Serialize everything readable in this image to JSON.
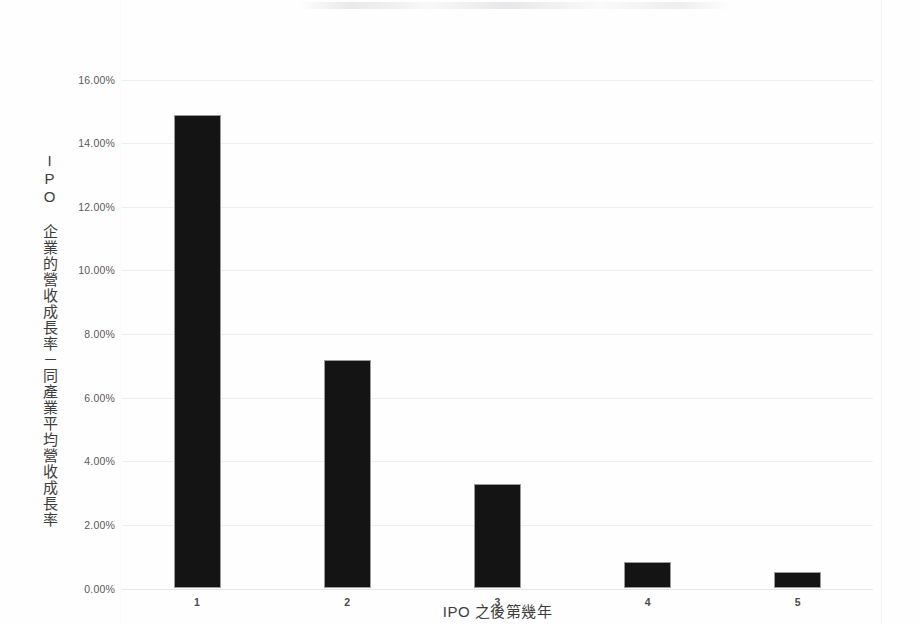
{
  "chart_data": {
    "type": "bar",
    "title": "",
    "subtitle": "",
    "categories": [
      "1",
      "2",
      "3",
      "4",
      "5"
    ],
    "values": [
      14.87,
      7.18,
      3.28,
      0.82,
      0.5
    ],
    "series": [
      {
        "name": "IPO 企業的營收成長率－同產業平均營收成長率",
        "values": [
          14.87,
          7.18,
          3.28,
          0.82,
          0.5
        ]
      }
    ],
    "xlabel": "IPO 之後第幾年",
    "ylabel": "IPO 企業的營收成長率－同產業平均營收成長率",
    "ylim": [
      0,
      16
    ],
    "ytick_labels": [
      "16.00%",
      "14.00%",
      "12.00%",
      "10.00%",
      "8.00%",
      "6.00%",
      "4.00%",
      "2.00%",
      "0.00%"
    ],
    "ytick_values": [
      16,
      14,
      12,
      10,
      8,
      6,
      4,
      2,
      0
    ],
    "grid": true,
    "legend": false,
    "legend_position": "none",
    "bar_color": "#141414",
    "grid_color": "#eeeeee",
    "text_color": "#3d3d3d",
    "background_color": "#ffffff",
    "value_format": "percent"
  },
  "axes": {
    "y_title": "IPO 企業的營收成長率－同產業平均營收成長率",
    "x_title": "IPO 之後第幾年"
  }
}
